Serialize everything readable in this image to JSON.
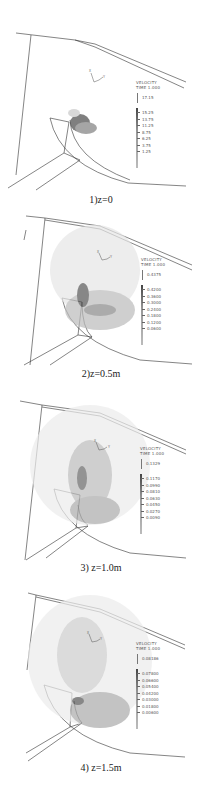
{
  "figure": {
    "panels": [
      {
        "caption": "1)z=0",
        "legend": {
          "title": "VELOCITY",
          "time": "TIME 1.000",
          "reference_vector": "17.15",
          "scale": [
            "15.25",
            "13.75",
            "11.25",
            "8.75",
            "6.25",
            "3.75",
            "1.25"
          ]
        }
      },
      {
        "caption": "2)z=0.5m",
        "legend": {
          "title": "VELOCITY",
          "time": "TIME 1.000",
          "reference_vector": "0.4375",
          "scale": [
            "0.4200",
            "0.3600",
            "0.3000",
            "0.2400",
            "0.1800",
            "0.1200",
            "0.0600"
          ]
        }
      },
      {
        "caption": "3) z=1.0m",
        "legend": {
          "title": "VELOCITY",
          "time": "TIME 1.000",
          "reference_vector": "0.1329",
          "scale": [
            "0.1170",
            "0.0990",
            "0.0810",
            "0.0630",
            "0.0450",
            "0.0270",
            "0.0090"
          ]
        }
      },
      {
        "caption": "4) z=1.5m",
        "legend": {
          "title": "VELOCITY",
          "time": "TIME 1.000",
          "reference_vector": "0.08186",
          "scale": [
            "0.07800",
            "0.06600",
            "0.05400",
            "0.04200",
            "0.03000",
            "0.01800",
            "0.00600"
          ]
        }
      }
    ],
    "axis_labels": {
      "x": "X",
      "y": "Y"
    }
  }
}
